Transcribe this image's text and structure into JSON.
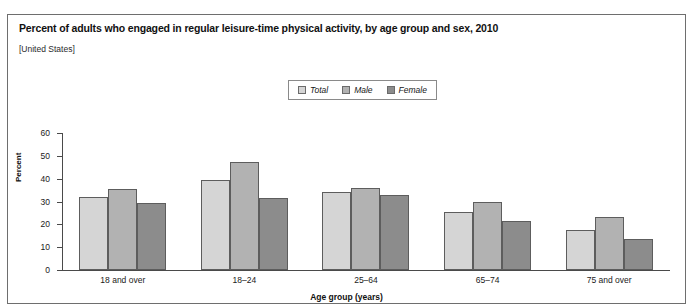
{
  "header": {
    "title": "Percent of adults who engaged in regular leisure-time physical activity, by age group and sex, 2010",
    "subtitle": "[United States]"
  },
  "chart_data": {
    "type": "bar",
    "title": "Percent of adults who engaged in regular leisure-time physical activity, by age group and sex, 2010",
    "subtitle": "[United States]",
    "xlabel": "Age group (years)",
    "ylabel": "Percent",
    "ylim": [
      0,
      60
    ],
    "yticks": [
      0,
      10,
      20,
      30,
      40,
      50,
      60
    ],
    "grid": false,
    "legend_position": "top-center",
    "categories": [
      "18 and over",
      "18–24",
      "25–64",
      "65–74",
      "75 and over"
    ],
    "series": [
      {
        "name": "Total",
        "color": "#d5d5d5",
        "values": [
          32.0,
          39.5,
          34.0,
          25.5,
          17.5
        ]
      },
      {
        "name": "Male",
        "color": "#b2b2b2",
        "values": [
          35.5,
          47.5,
          36.0,
          30.0,
          23.0
        ]
      },
      {
        "name": "Female",
        "color": "#8c8c8c",
        "values": [
          29.5,
          31.5,
          33.0,
          21.5,
          13.5
        ]
      }
    ]
  }
}
